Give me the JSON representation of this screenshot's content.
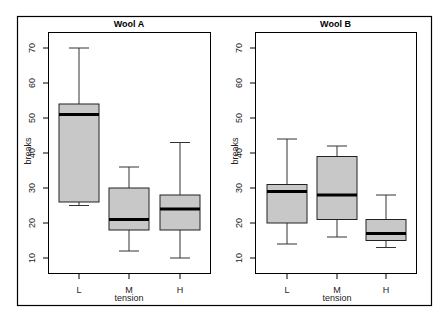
{
  "chart_data": [
    {
      "type": "box",
      "title": "Wool A",
      "xlabel": "tension",
      "ylabel": "breaks",
      "categories": [
        "L",
        "M",
        "H"
      ],
      "yticks": [
        10,
        20,
        30,
        40,
        50,
        60,
        70
      ],
      "ylim": [
        5,
        75
      ],
      "boxes": [
        {
          "category": "L",
          "min": 25,
          "q1": 26,
          "median": 51,
          "q3": 54,
          "max": 70
        },
        {
          "category": "M",
          "min": 12,
          "q1": 18,
          "median": 21,
          "q3": 30,
          "max": 36
        },
        {
          "category": "H",
          "min": 10,
          "q1": 18,
          "median": 24,
          "q3": 28,
          "max": 43
        }
      ]
    },
    {
      "type": "box",
      "title": "Wool B",
      "xlabel": "tension",
      "ylabel": "breaks",
      "categories": [
        "L",
        "M",
        "H"
      ],
      "yticks": [
        10,
        20,
        30,
        40,
        50,
        60,
        70
      ],
      "ylim": [
        5,
        75
      ],
      "boxes": [
        {
          "category": "L",
          "min": 14,
          "q1": 20,
          "median": 29,
          "q3": 31,
          "max": 44
        },
        {
          "category": "M",
          "min": 16,
          "q1": 21,
          "median": 28,
          "q3": 39,
          "max": 42
        },
        {
          "category": "H",
          "min": 13,
          "q1": 15,
          "median": 17,
          "q3": 21,
          "max": 28
        }
      ]
    }
  ],
  "style": {
    "box_fill": "#c8c8c8",
    "median_color": "#000000",
    "frame_color": "#000000"
  }
}
